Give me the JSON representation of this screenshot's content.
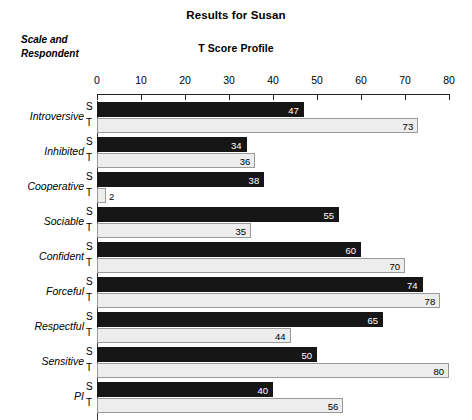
{
  "header": {
    "title": "Results for Susan",
    "subtitle": "T Score Profile",
    "corner_line1": "Scale and",
    "corner_line2": "Respondent"
  },
  "colors": {
    "self_bar": "#161616",
    "other_bar": "#ededed",
    "other_bar_border": "#9a9a9a",
    "axis": "#242424",
    "background": "#ffffff"
  },
  "respondent_codes": {
    "self": "S",
    "other": "T"
  },
  "chart_data": {
    "type": "bar",
    "orientation": "horizontal",
    "title": "Results for Susan",
    "subtitle": "T Score Profile",
    "xlabel": "",
    "ylabel": "Scale and Respondent",
    "xlim": [
      0,
      80
    ],
    "xticks": [
      0,
      10,
      20,
      30,
      40,
      50,
      60,
      70,
      80
    ],
    "xtick_labels": [
      "0",
      "10",
      "20",
      "30",
      "40",
      "50",
      "60",
      "70",
      "80"
    ],
    "grid": false,
    "legend": "none",
    "categories": [
      "Introversive",
      "Inhibited",
      "Cooperative",
      "Sociable",
      "Confident",
      "Forceful",
      "Respectful",
      "Sensitive",
      "PI"
    ],
    "series": [
      {
        "name": "S",
        "values": [
          47,
          34,
          38,
          55,
          60,
          74,
          65,
          50,
          40
        ]
      },
      {
        "name": "T",
        "values": [
          73,
          36,
          2,
          35,
          70,
          78,
          44,
          80,
          56
        ]
      }
    ]
  },
  "rows": [
    {
      "scale": "Introversive",
      "s": {
        "code": "S",
        "value": 47,
        "label": "47"
      },
      "t": {
        "code": "T",
        "value": 73,
        "label": "73"
      }
    },
    {
      "scale": "Inhibited",
      "s": {
        "code": "S",
        "value": 34,
        "label": "34"
      },
      "t": {
        "code": "T",
        "value": 36,
        "label": "36"
      }
    },
    {
      "scale": "Cooperative",
      "s": {
        "code": "S",
        "value": 38,
        "label": "38"
      },
      "t": {
        "code": "T",
        "value": 2,
        "label": "2"
      }
    },
    {
      "scale": "Sociable",
      "s": {
        "code": "S",
        "value": 55,
        "label": "55"
      },
      "t": {
        "code": "T",
        "value": 35,
        "label": "35"
      }
    },
    {
      "scale": "Confident",
      "s": {
        "code": "S",
        "value": 60,
        "label": "60"
      },
      "t": {
        "code": "T",
        "value": 70,
        "label": "70"
      }
    },
    {
      "scale": "Forceful",
      "s": {
        "code": "S",
        "value": 74,
        "label": "74"
      },
      "t": {
        "code": "T",
        "value": 78,
        "label": "78"
      }
    },
    {
      "scale": "Respectful",
      "s": {
        "code": "S",
        "value": 65,
        "label": "65"
      },
      "t": {
        "code": "T",
        "value": 44,
        "label": "44"
      }
    },
    {
      "scale": "Sensitive",
      "s": {
        "code": "S",
        "value": 50,
        "label": "50"
      },
      "t": {
        "code": "T",
        "value": 80,
        "label": "80"
      }
    },
    {
      "scale": "PI",
      "s": {
        "code": "S",
        "value": 40,
        "label": "40"
      },
      "t": {
        "code": "T",
        "value": 56,
        "label": "56"
      }
    }
  ]
}
